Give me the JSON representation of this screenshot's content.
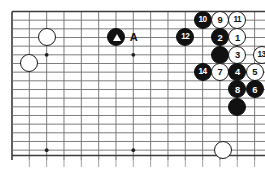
{
  "diagram": {
    "kind": "go-board-diagram",
    "board_region": "right-side portion of a 19x19 go board, top-right corner area",
    "grid": {
      "origin_x": 12,
      "origin_y": 11.5,
      "spacing": 17.33,
      "cols": 15,
      "rows": 9,
      "border_color": "#3a3a3a",
      "line_color": "#6e6e6e",
      "background": "#ffffff"
    },
    "star_points": [
      {
        "col": 2,
        "row": 2.5
      },
      {
        "col": 7,
        "row": 2.5
      },
      {
        "col": 2,
        "row": 8
      },
      {
        "col": 7,
        "row": 8
      },
      {
        "col": 12,
        "row": 8
      }
    ],
    "stones": [
      {
        "id": "w-upper-left-a",
        "color": "white",
        "col": 2,
        "row": 1.5,
        "label": ""
      },
      {
        "id": "w-upper-left-b",
        "color": "white",
        "col": 1,
        "row": 3,
        "label": ""
      },
      {
        "id": "b-triangle",
        "color": "black",
        "col": 6,
        "row": 1.5,
        "label": "",
        "mark": "triangle"
      },
      {
        "id": "b-12",
        "color": "black",
        "col": 10,
        "row": 1.5,
        "label": "12"
      },
      {
        "id": "b-10",
        "color": "black",
        "col": 11,
        "row": 0.5,
        "label": "10"
      },
      {
        "id": "w-9",
        "color": "white",
        "col": 12,
        "row": 0.5,
        "label": "9"
      },
      {
        "id": "w-11",
        "color": "white",
        "col": 13,
        "row": 0.5,
        "label": "11"
      },
      {
        "id": "b-2",
        "color": "black",
        "col": 12,
        "row": 1.5,
        "label": "2"
      },
      {
        "id": "w-1",
        "color": "white",
        "col": 13,
        "row": 1.5,
        "label": "1"
      },
      {
        "id": "b-plain-a",
        "color": "black",
        "col": 12,
        "row": 2.5,
        "label": ""
      },
      {
        "id": "w-3",
        "color": "white",
        "col": 13,
        "row": 2.5,
        "label": "3"
      },
      {
        "id": "w-13",
        "color": "white",
        "col": 14.4,
        "row": 2.5,
        "label": "13"
      },
      {
        "id": "b-14",
        "color": "black",
        "col": 11,
        "row": 3.5,
        "label": "14"
      },
      {
        "id": "w-7",
        "color": "white",
        "col": 12,
        "row": 3.5,
        "label": "7"
      },
      {
        "id": "b-4",
        "color": "black",
        "col": 13,
        "row": 3.5,
        "label": "4"
      },
      {
        "id": "w-5",
        "color": "white",
        "col": 14,
        "row": 3.5,
        "label": "5"
      },
      {
        "id": "b-8",
        "color": "black",
        "col": 13,
        "row": 4.5,
        "label": "8"
      },
      {
        "id": "b-6",
        "color": "black",
        "col": 14,
        "row": 4.5,
        "label": "6"
      },
      {
        "id": "b-plain-b",
        "color": "black",
        "col": 13,
        "row": 5.5,
        "label": ""
      },
      {
        "id": "w-lower-right",
        "color": "white",
        "col": 12.2,
        "row": 8,
        "label": ""
      }
    ],
    "annotations": [
      {
        "id": "point-a",
        "text": "A",
        "col": 7,
        "row": 1.5
      }
    ]
  }
}
